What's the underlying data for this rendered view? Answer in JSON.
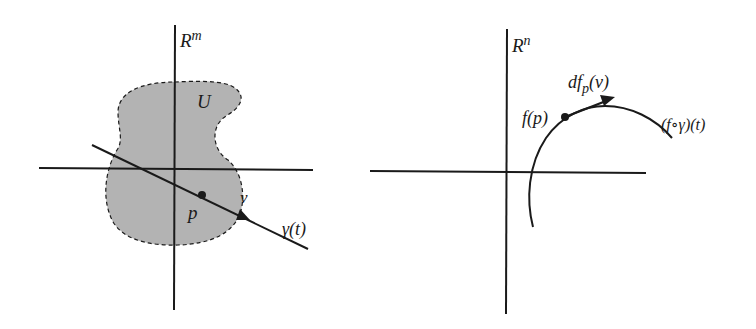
{
  "figure": {
    "left_panel": {
      "space_label": "R",
      "space_superscript": "m",
      "region_label": "U",
      "point_label": "p",
      "vector_label": "v",
      "curve_label": "γ(t)"
    },
    "right_panel": {
      "space_label": "R",
      "space_superscript": "n",
      "point_label": "f(p)",
      "vector_label_prefix": "df",
      "vector_label_subscript": "p",
      "vector_label_suffix": "(v)",
      "curve_label": "(f∘γ)(t)"
    },
    "colors": {
      "ink": "#1a1a1a",
      "region_fill": "#b3b3b3",
      "background": "#ffffff"
    }
  }
}
